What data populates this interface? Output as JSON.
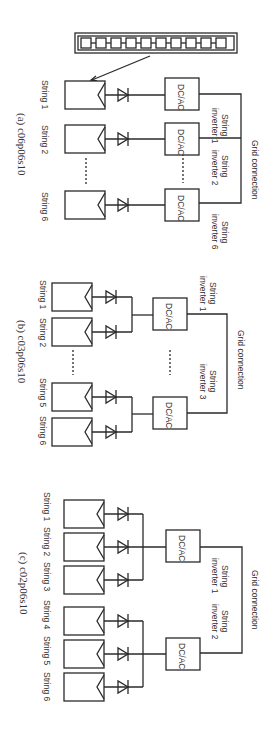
{
  "orientation": "rotated 90deg clockwise",
  "panels": [
    {
      "id": "a",
      "caption": "(a) c06p06s10",
      "grid_label": "Grid connection",
      "module_inset": "module string detail (10 modules in series)",
      "strings": [
        "String 1",
        "String 2",
        "String 6"
      ],
      "inverters": [
        {
          "label_1": "String",
          "label_2": "inverter 1",
          "box": "DC/AC"
        },
        {
          "label_1": "String",
          "label_2": "inverter 2",
          "box": "DC/AC"
        },
        {
          "label_1": "String",
          "label_2": "inverter 6",
          "box": "DC/AC"
        }
      ],
      "ellipsis": "......"
    },
    {
      "id": "b",
      "caption": "(b) c03p06s10",
      "grid_label": "Grid connection",
      "strings": [
        "String 1",
        "String 2",
        "String 5",
        "String 6"
      ],
      "inverters": [
        {
          "label_1": "String",
          "label_2": "inverter 1",
          "box": "DC/AC"
        },
        {
          "label_1": "String",
          "label_2": "inverter 3",
          "box": "DC/AC"
        }
      ],
      "ellipsis": "......"
    },
    {
      "id": "c",
      "caption": "(c) c02p06s10",
      "grid_label": "Grid connection",
      "strings": [
        "String 1",
        "String 2",
        "String 3",
        "String 4",
        "String 5",
        "String 6"
      ],
      "inverters": [
        {
          "label_1": "String",
          "label_2": "inverter 1",
          "box": "DC/AC"
        },
        {
          "label_1": "String",
          "label_2": "inverter 2",
          "box": "DC/AC"
        }
      ]
    }
  ]
}
